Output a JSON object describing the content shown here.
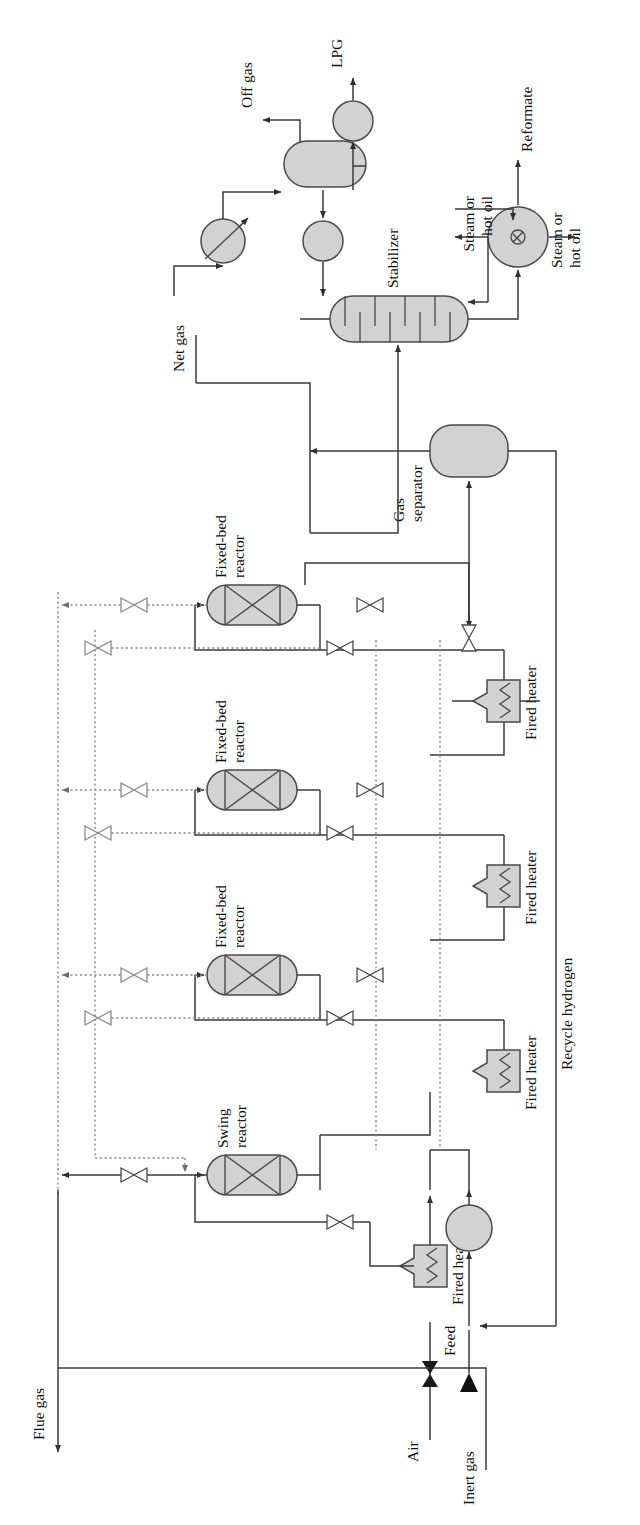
{
  "diagram": {
    "orientation_note": "page-rotated-90-ccw",
    "colors": {
      "vessel_fill": "#d2d2d2",
      "vessel_stroke": "#4a4a4a",
      "process_line": "#3a3a3a",
      "regeneration_line": "#7a7a7a",
      "text": "#111111",
      "background": "#ffffff"
    },
    "line_styles": {
      "process": "solid",
      "regeneration": "dotted"
    }
  },
  "equipment": [
    {
      "id": "swing-reactor",
      "label": "Swing\nreactor",
      "label_line1": "Swing",
      "label_line2": "reactor",
      "type": "fixed-bed-vessel"
    },
    {
      "id": "fixed-bed-reactor-1",
      "label": "Fixed-bed\nreactor",
      "label_line1": "Fixed-bed",
      "label_line2": "reactor",
      "type": "fixed-bed-vessel"
    },
    {
      "id": "fixed-bed-reactor-2",
      "label": "Fixed-bed\nreactor",
      "label_line1": "Fixed-bed",
      "label_line2": "reactor",
      "type": "fixed-bed-vessel"
    },
    {
      "id": "fixed-bed-reactor-3",
      "label": "Fixed-bed\nreactor",
      "label_line1": "Fixed-bed",
      "label_line2": "reactor",
      "type": "fixed-bed-vessel"
    },
    {
      "id": "fired-heater-0",
      "label": "Fired heater",
      "type": "fired-heater"
    },
    {
      "id": "fired-heater-1",
      "label": "Fired heater",
      "type": "fired-heater"
    },
    {
      "id": "fired-heater-2",
      "label": "Fired heater",
      "type": "fired-heater"
    },
    {
      "id": "fired-heater-3",
      "label": "Fired heater",
      "type": "fired-heater"
    },
    {
      "id": "feed-pump",
      "label": "",
      "type": "pump"
    },
    {
      "id": "gas-separator",
      "label": "Gas\nseparator",
      "label_line1": "Gas",
      "label_line2": "separator",
      "type": "drum"
    },
    {
      "id": "stabilizer",
      "label": "Stabilizer",
      "type": "trayed-column",
      "trays": 9
    },
    {
      "id": "overhead-condenser",
      "label": "",
      "type": "air-cooler"
    },
    {
      "id": "reflux-drum",
      "label": "",
      "type": "vertical-drum"
    },
    {
      "id": "reflux-pump",
      "label": "",
      "type": "pump"
    },
    {
      "id": "lpg-pump",
      "label": "",
      "type": "pump"
    },
    {
      "id": "reboiler",
      "label": "",
      "type": "reboiler"
    }
  ],
  "streams": [
    {
      "id": "feed",
      "label": "Feed",
      "style": "process"
    },
    {
      "id": "air",
      "label": "Air",
      "style": "process"
    },
    {
      "id": "inert-gas",
      "label": "Inert gas",
      "style": "process"
    },
    {
      "id": "flue-gas",
      "label": "Flue gas",
      "style": "process"
    },
    {
      "id": "recycle-hydrogen",
      "label": "Recycle hydrogen",
      "style": "process"
    },
    {
      "id": "net-gas",
      "label": "Net gas",
      "style": "process"
    },
    {
      "id": "off-gas",
      "label": "Off gas",
      "style": "process"
    },
    {
      "id": "lpg",
      "label": "LPG",
      "style": "process"
    },
    {
      "id": "reformate",
      "label": "Reformate",
      "style": "process"
    },
    {
      "id": "steam-hot-oil-in",
      "label_line1": "Steam or",
      "label_line2": "hot oil",
      "label": "Steam or hot oil",
      "style": "process"
    },
    {
      "id": "steam-hot-oil-out",
      "label_line1": "Steam or",
      "label_line2": "hot oil",
      "label": "Steam or hot oil",
      "style": "process"
    }
  ],
  "labels": {
    "off_gas": "Off gas",
    "lpg": "LPG",
    "stabilizer": "Stabilizer",
    "steam_or": "Steam or",
    "hot_oil": "hot oil",
    "reformate": "Reformate",
    "net_gas": "Net gas",
    "gas": "Gas",
    "separator": "separator",
    "fixed_bed": "Fixed-bed",
    "reactor": "reactor",
    "swing": "Swing",
    "fired_heater": "Fired heater",
    "recycle_hydrogen": "Recycle hydrogen",
    "feed": "Feed",
    "air": "Air",
    "inert_gas": "Inert gas",
    "flue_gas": "Flue gas"
  },
  "valve_count": 13
}
